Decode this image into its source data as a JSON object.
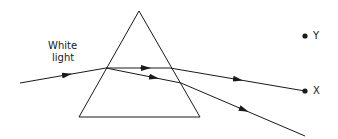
{
  "diagram": {
    "labels": {
      "incoming_line1": "White",
      "incoming_line2": "light",
      "point_y": "Y",
      "point_x": "X"
    },
    "colors": {
      "stroke": "#1a1a1a",
      "background": "#ffffff"
    },
    "prism": {
      "apex": [
        139,
        11
      ],
      "base_left": [
        79,
        117
      ],
      "base_right": [
        200,
        117
      ]
    },
    "rays": [
      {
        "name": "incident-ray",
        "from": [
          20,
          83
        ],
        "to": [
          106,
          68
        ]
      },
      {
        "name": "refracted-ray-1-inside",
        "from": [
          106,
          68
        ],
        "to": [
          170,
          68
        ]
      },
      {
        "name": "refracted-ray-1-outside",
        "from": [
          170,
          68
        ],
        "to": [
          305,
          91
        ]
      },
      {
        "name": "refracted-ray-2-inside",
        "from": [
          106,
          68
        ],
        "to": [
          181,
          83
        ]
      },
      {
        "name": "refracted-ray-2-outside",
        "from": [
          181,
          83
        ],
        "to": [
          305,
          136
        ]
      }
    ],
    "points": [
      {
        "name": "Y",
        "pos": [
          305,
          36
        ]
      },
      {
        "name": "X",
        "pos": [
          305,
          91
        ]
      }
    ]
  }
}
